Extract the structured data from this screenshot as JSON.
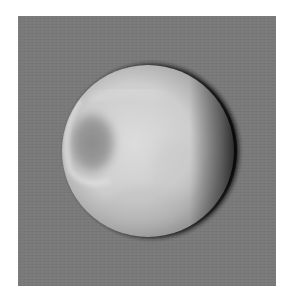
{
  "image": {
    "subject": "Grayscale photograph of a cratered moon, partially lit, with a large crater near the left limb",
    "colors": {
      "background_frame": "#7a7a7a",
      "page": "#ffffff",
      "moon_bright": "#d8d8d8",
      "moon_mid": "#bdbdbd",
      "terminator_shadow": "#1e1e1e",
      "crater_floor": "#8e8e8e"
    }
  }
}
